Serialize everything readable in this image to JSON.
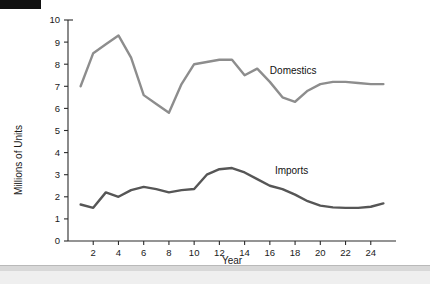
{
  "page": {
    "background_color": "#ffffff",
    "top_bar_color": "#111111",
    "footer_band_color": "#d8d8d8"
  },
  "chart_data": {
    "type": "line",
    "title": "",
    "xlabel": "Year",
    "ylabel": "Millions of Units",
    "xlim": [
      0,
      26
    ],
    "ylim": [
      0,
      10
    ],
    "grid": false,
    "legend_position": "inline-annotation",
    "x_tick_labels": [
      "2",
      "4",
      "6",
      "8",
      "10",
      "12",
      "14",
      "16",
      "18",
      "20",
      "22",
      "24"
    ],
    "x_tick_values": [
      2,
      4,
      6,
      8,
      10,
      12,
      14,
      16,
      18,
      20,
      22,
      24
    ],
    "y_tick_labels": [
      "0",
      "1",
      "2",
      "3",
      "4",
      "5",
      "6",
      "7",
      "8",
      "9",
      "10"
    ],
    "y_tick_values": [
      0,
      1,
      2,
      3,
      4,
      5,
      6,
      7,
      8,
      9,
      10
    ],
    "x": [
      1,
      2,
      3,
      4,
      5,
      6,
      7,
      8,
      9,
      10,
      11,
      12,
      13,
      14,
      15,
      16,
      17,
      18,
      19,
      20,
      21,
      22,
      23,
      24,
      25
    ],
    "series": [
      {
        "name": "Domestics",
        "color": "#8d8d8d",
        "line_width": 2.4,
        "label_x": 16.0,
        "label_y": 7.55,
        "values": [
          7.0,
          8.5,
          8.9,
          9.3,
          8.3,
          6.6,
          6.2,
          5.8,
          7.1,
          8.0,
          8.1,
          8.2,
          8.2,
          7.5,
          7.8,
          7.2,
          6.5,
          6.3,
          6.8,
          7.1,
          7.2,
          7.2,
          7.15,
          7.1,
          7.1
        ]
      },
      {
        "name": "Imports",
        "color": "#565656",
        "line_width": 2.4,
        "label_x": 16.4,
        "label_y": 3.05,
        "values": [
          1.65,
          1.5,
          2.2,
          2.0,
          2.3,
          2.45,
          2.35,
          2.2,
          2.3,
          2.35,
          3.0,
          3.25,
          3.3,
          3.1,
          2.8,
          2.5,
          2.35,
          2.1,
          1.8,
          1.6,
          1.52,
          1.5,
          1.5,
          1.55,
          1.7
        ]
      }
    ]
  },
  "axes": {
    "y_axis_title": "Millions of Units",
    "x_axis_title": "Year",
    "axis_color": "#2b2b2b"
  }
}
